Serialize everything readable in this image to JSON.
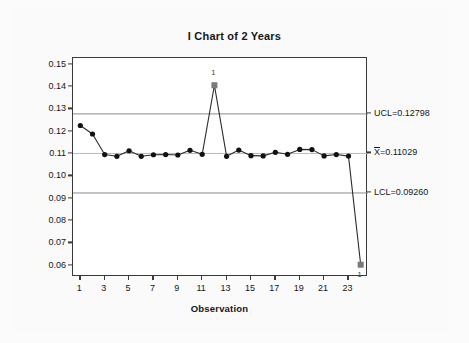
{
  "chart_data": {
    "type": "line",
    "title": "I Chart of 2 Years",
    "xlabel": "Observation",
    "ylabel": "Individual Value",
    "x": [
      1,
      2,
      3,
      4,
      5,
      6,
      7,
      8,
      9,
      10,
      11,
      12,
      13,
      14,
      15,
      16,
      17,
      18,
      19,
      20,
      21,
      22,
      23,
      24
    ],
    "values": [
      0.1228,
      0.119,
      0.1098,
      0.109,
      0.1115,
      0.109,
      0.1097,
      0.1098,
      0.1096,
      0.1117,
      0.1099,
      0.1408,
      0.109,
      0.1118,
      0.1093,
      0.1092,
      0.1108,
      0.1099,
      0.1121,
      0.112,
      0.1092,
      0.1098,
      0.1091,
      0.0605
    ],
    "series": [
      {
        "name": "Individual Value",
        "values": [
          0.1228,
          0.119,
          0.1098,
          0.109,
          0.1115,
          0.109,
          0.1097,
          0.1098,
          0.1096,
          0.1117,
          0.1099,
          0.1408,
          0.109,
          0.1118,
          0.1093,
          0.1092,
          0.1108,
          0.1099,
          0.1121,
          0.112,
          0.1092,
          0.1098,
          0.1091,
          0.0605
        ]
      }
    ],
    "ylim": [
      0.055,
      0.153
    ],
    "xlim": [
      0.4,
      24.6
    ],
    "yticks": [
      "0.06",
      "0.07",
      "0.08",
      "0.09",
      "0.10",
      "0.11",
      "0.12",
      "0.13",
      "0.14",
      "0.15"
    ],
    "ytick_values": [
      0.06,
      0.07,
      0.08,
      0.09,
      0.1,
      0.11,
      0.12,
      0.13,
      0.14,
      0.15
    ],
    "xticks": [
      "1",
      "3",
      "5",
      "7",
      "9",
      "11",
      "13",
      "15",
      "17",
      "19",
      "21",
      "23"
    ],
    "xtick_values": [
      1,
      3,
      5,
      7,
      9,
      11,
      13,
      15,
      17,
      19,
      21,
      23
    ],
    "grid": false,
    "legend": "none",
    "control_limits": {
      "ucl": {
        "label": "UCL=0.12798",
        "value": 0.12798
      },
      "center": {
        "label_prefix": "X",
        "label_suffix": "=0.11029",
        "value": 0.11029
      },
      "lcl": {
        "label": "LCL=0.09260",
        "value": 0.0926
      }
    },
    "violations": [
      {
        "x": 12,
        "y": 0.1408,
        "label": "1",
        "position": "above"
      },
      {
        "x": 24,
        "y": 0.0605,
        "label": "1",
        "position": "below"
      }
    ],
    "colors": {
      "line": "#2b2b2b",
      "marker": "#111111",
      "violation_marker": "#7a7a7a",
      "limit_line": "#8a8a8a",
      "center_line": "#b9b9b9",
      "axis": "#3a3a3a",
      "text": "#15161a",
      "plot_background": "#ffffff",
      "page_background": "#fafafa"
    }
  }
}
